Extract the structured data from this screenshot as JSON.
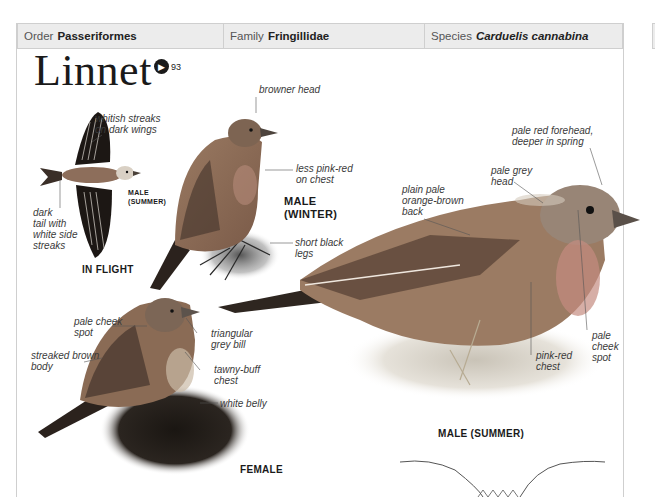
{
  "header": {
    "order": {
      "label": "Order",
      "value": "Passeriformes"
    },
    "family": {
      "label": "Family",
      "value": "Fringillidae"
    },
    "species": {
      "label": "Species",
      "value": "Carduelis cannabina"
    }
  },
  "title": "Linnet",
  "audio": {
    "icon": "speaker-icon",
    "track": "93"
  },
  "illustrations": {
    "in_flight": {
      "caption": "IN FLIGHT",
      "sub_caption_line1": "MALE",
      "sub_caption_line2": "(SUMMER)",
      "annotations": [
        {
          "line1": "whitish streaks",
          "line2": "on dark wings"
        },
        {
          "line1": "dark",
          "line2": "tail with",
          "line3": "white side",
          "line4": "streaks"
        }
      ]
    },
    "male_winter": {
      "caption_line1": "MALE",
      "caption_line2": "(WINTER)",
      "annotations": [
        {
          "line1": "browner head"
        },
        {
          "line1": "less pink-red",
          "line2": "on chest"
        },
        {
          "line1": "short black",
          "line2": "legs"
        }
      ]
    },
    "male_summer": {
      "caption": "MALE (SUMMER)",
      "annotations": [
        {
          "line1": "pale red forehead,",
          "line2": "deeper in spring"
        },
        {
          "line1": "pale grey",
          "line2": "head"
        },
        {
          "line1": "plain pale",
          "line2": "orange-brown",
          "line3": "back"
        },
        {
          "line1": "pale",
          "line2": "cheek",
          "line3": "spot"
        },
        {
          "line1": "pink-red",
          "line2": "chest"
        }
      ]
    },
    "female": {
      "caption": "FEMALE",
      "annotations": [
        {
          "line1": "pale cheek",
          "line2": "spot"
        },
        {
          "line1": "triangular",
          "line2": "grey bill"
        },
        {
          "line1": "streaked brown",
          "line2": "body"
        },
        {
          "line1": "tawny-buff",
          "line2": "chest"
        },
        {
          "line1": "white belly"
        }
      ]
    }
  },
  "colors": {
    "header_bg": "#ececec",
    "border": "#cfcfcf",
    "bird_brown": "#8a6a52",
    "bird_dark": "#3b2d25",
    "chest_pink": "#c78a7f"
  }
}
